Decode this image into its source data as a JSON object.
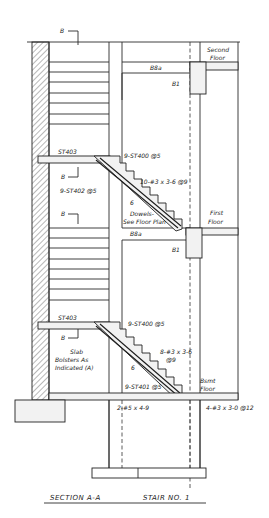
{
  "drawing": {
    "title_left": "SECTION A-A",
    "title_right": "STAIR NO. 1",
    "section_markers": [
      "B",
      "B",
      "B",
      "B",
      "B"
    ],
    "floors": {
      "second": [
        "Second",
        "Floor"
      ],
      "first": [
        "First",
        "Floor"
      ],
      "basement": [
        "Bsmt",
        "Floor"
      ]
    },
    "beams": {
      "upper_beam": "B8a",
      "lower_beam": "B8a",
      "upper_b1": "B1",
      "lower_b1": "B1"
    },
    "upper_flight": {
      "landing_bar": "ST403",
      "top_bar": "9-ST400 @5",
      "bottom_bar": "9-ST402 @5",
      "stirrups": "10-#3 x 3-6 @9",
      "dowels": [
        "Dowels-",
        "See Floor Plan"
      ],
      "rise_mark": "6"
    },
    "lower_flight": {
      "landing_bar": "ST403",
      "top_bar": "9-ST400 @5",
      "bottom_bar": "9-ST401 @5",
      "stirrups": [
        "8-#3 x 3-6",
        "@9"
      ],
      "bolsters": [
        "Slab",
        "Bolsters As",
        "Indicated (A)"
      ],
      "rise_mark": "6"
    },
    "footing_bars": {
      "left": "2-#5 x 4-9",
      "right": "4-#3 x 3-0 @12"
    }
  }
}
